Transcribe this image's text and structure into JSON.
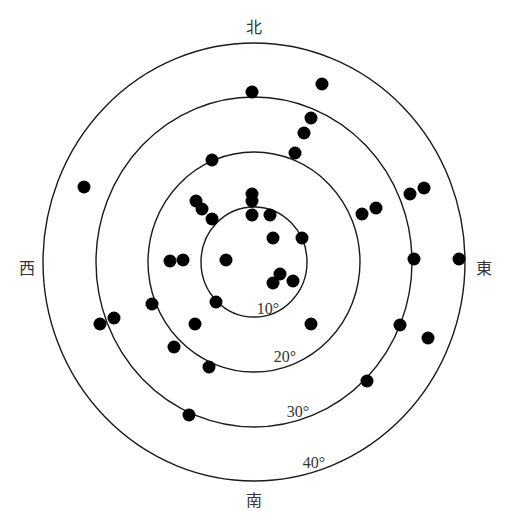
{
  "diagram": {
    "type": "polar-sky-plot",
    "center": {
      "x": 254,
      "y": 262
    },
    "directions": {
      "north": "北",
      "south": "南",
      "west": "西",
      "east": "東"
    },
    "rings": [
      {
        "label": "10°",
        "rx": 53,
        "ry": 55,
        "label_x": 268,
        "label_y": 314
      },
      {
        "label": "20°",
        "rx": 106,
        "ry": 110,
        "label_x": 285,
        "label_y": 362
      },
      {
        "label": "30°",
        "rx": 158,
        "ry": 165,
        "label_x": 298,
        "label_y": 417
      },
      {
        "label": "40°",
        "rx": 211,
        "ry": 219,
        "label_x": 314,
        "label_y": 468
      }
    ],
    "dot_radius": 6.5,
    "dot_color": "#000000",
    "points": [
      {
        "x": 252,
        "y": 92
      },
      {
        "x": 322,
        "y": 84
      },
      {
        "x": 311,
        "y": 118
      },
      {
        "x": 304,
        "y": 133
      },
      {
        "x": 295,
        "y": 153
      },
      {
        "x": 212,
        "y": 160
      },
      {
        "x": 84,
        "y": 187
      },
      {
        "x": 410,
        "y": 194
      },
      {
        "x": 424,
        "y": 188
      },
      {
        "x": 362,
        "y": 214
      },
      {
        "x": 376,
        "y": 208
      },
      {
        "x": 196,
        "y": 201
      },
      {
        "x": 202,
        "y": 209
      },
      {
        "x": 212,
        "y": 219
      },
      {
        "x": 252,
        "y": 194
      },
      {
        "x": 252,
        "y": 201
      },
      {
        "x": 252,
        "y": 215
      },
      {
        "x": 270,
        "y": 215
      },
      {
        "x": 273,
        "y": 238
      },
      {
        "x": 302,
        "y": 238
      },
      {
        "x": 414,
        "y": 259
      },
      {
        "x": 459,
        "y": 259
      },
      {
        "x": 170,
        "y": 261
      },
      {
        "x": 183,
        "y": 260
      },
      {
        "x": 226,
        "y": 260
      },
      {
        "x": 280,
        "y": 274
      },
      {
        "x": 273,
        "y": 283
      },
      {
        "x": 293,
        "y": 281
      },
      {
        "x": 152,
        "y": 304
      },
      {
        "x": 216,
        "y": 302
      },
      {
        "x": 100,
        "y": 324
      },
      {
        "x": 114,
        "y": 318
      },
      {
        "x": 195,
        "y": 324
      },
      {
        "x": 311,
        "y": 324
      },
      {
        "x": 400,
        "y": 325
      },
      {
        "x": 428,
        "y": 338
      },
      {
        "x": 174,
        "y": 347
      },
      {
        "x": 209,
        "y": 367
      },
      {
        "x": 367,
        "y": 381
      },
      {
        "x": 189,
        "y": 415
      }
    ]
  }
}
